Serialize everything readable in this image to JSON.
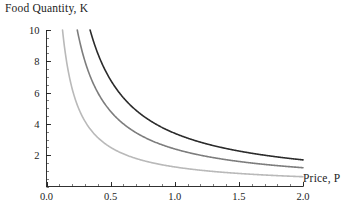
{
  "chart_data": {
    "type": "line",
    "title": "",
    "xlabel": "Price, P",
    "ylabel": "Food Quantity, K",
    "xlim": [
      0.0,
      2.0
    ],
    "ylim": [
      0.0,
      10.0
    ],
    "grid": false,
    "legend": "none",
    "x_ticks": [
      0.0,
      0.5,
      1.0,
      1.5,
      2.0
    ],
    "x_tick_labels": [
      "0.0",
      "0.5",
      "1.0",
      "1.5",
      "2.0"
    ],
    "x_minor_step": 0.1,
    "y_ticks": [
      2,
      4,
      6,
      8,
      10
    ],
    "y_tick_labels": [
      "2",
      "4",
      "6",
      "8",
      "10"
    ],
    "y_minor_step": 0.5,
    "series": [
      {
        "name": "low-budget-curve",
        "color": "#b9b9b9",
        "k": 1.25,
        "x": [
          0.125,
          0.15,
          0.175,
          0.2,
          0.25,
          0.3,
          0.35,
          0.4,
          0.5,
          0.6,
          0.7,
          0.8,
          0.9,
          1.0,
          1.2,
          1.4,
          1.6,
          1.8,
          2.0
        ],
        "values": [
          10.0,
          8.33,
          7.14,
          6.25,
          5.0,
          4.17,
          3.57,
          3.13,
          2.5,
          2.08,
          1.79,
          1.56,
          1.39,
          1.25,
          1.04,
          0.89,
          0.78,
          0.69,
          0.63
        ]
      },
      {
        "name": "mid-budget-curve",
        "color": "#7d7d7d",
        "k": 2.4,
        "x": [
          0.24,
          0.3,
          0.35,
          0.4,
          0.5,
          0.6,
          0.7,
          0.8,
          0.9,
          1.0,
          1.2,
          1.4,
          1.6,
          1.8,
          2.0
        ],
        "values": [
          10.0,
          8.0,
          6.86,
          6.0,
          4.8,
          4.0,
          3.43,
          3.0,
          2.67,
          2.4,
          2.0,
          1.71,
          1.5,
          1.33,
          1.2
        ]
      },
      {
        "name": "high-budget-curve",
        "color": "#2b2b2b",
        "k": 3.4,
        "x": [
          0.34,
          0.4,
          0.5,
          0.6,
          0.7,
          0.8,
          0.9,
          1.0,
          1.2,
          1.4,
          1.6,
          1.8,
          2.0
        ],
        "values": [
          10.0,
          8.5,
          6.8,
          5.67,
          4.86,
          4.25,
          3.78,
          3.4,
          2.83,
          2.43,
          2.13,
          1.89,
          1.7
        ]
      }
    ]
  }
}
